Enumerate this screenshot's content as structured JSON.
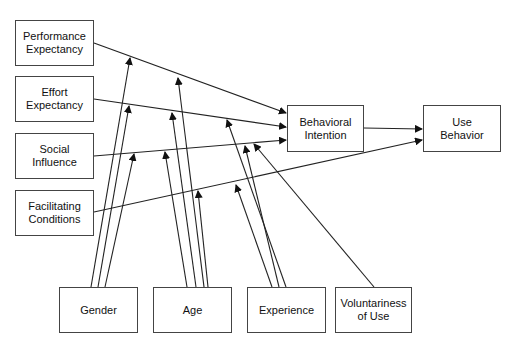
{
  "diagram": {
    "title": "",
    "constructs": [
      {
        "id": "pe",
        "label": "Performance\nExpectancy"
      },
      {
        "id": "ee",
        "label": "Effort\nExpectancy"
      },
      {
        "id": "si",
        "label": "Social\nInfluence"
      },
      {
        "id": "fc",
        "label": "Facilitating\nConditions"
      },
      {
        "id": "bi",
        "label": "Behavioral\nIntention"
      },
      {
        "id": "ub",
        "label": "Use\nBehavior"
      }
    ],
    "moderators": [
      {
        "id": "gender",
        "label": "Gender"
      },
      {
        "id": "age",
        "label": "Age"
      },
      {
        "id": "experience",
        "label": "Experience"
      },
      {
        "id": "voluntariness",
        "label": "Voluntariness\nof Use"
      }
    ],
    "edges": [
      {
        "from": "pe",
        "to": "bi"
      },
      {
        "from": "ee",
        "to": "bi"
      },
      {
        "from": "si",
        "to": "bi"
      },
      {
        "from": "fc",
        "to": "ub"
      },
      {
        "from": "bi",
        "to": "ub"
      }
    ],
    "moderations": [
      {
        "moderator": "gender",
        "on": [
          "pe->bi",
          "ee->bi",
          "si->bi"
        ]
      },
      {
        "moderator": "age",
        "on": [
          "pe->bi",
          "ee->bi",
          "si->bi",
          "fc->ub"
        ]
      },
      {
        "moderator": "experience",
        "on": [
          "ee->bi",
          "si->bi",
          "fc->ub"
        ]
      },
      {
        "moderator": "voluntariness",
        "on": [
          "si->bi"
        ]
      }
    ]
  }
}
